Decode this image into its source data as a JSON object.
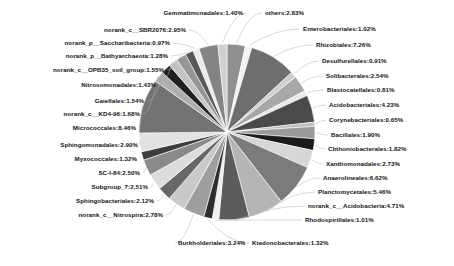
{
  "chart_data": {
    "type": "pie",
    "title": "",
    "subtitle": "",
    "xlabel": "",
    "ylabel": "",
    "legend_position": "none",
    "grid": false,
    "value_unit": "percent",
    "categories": [
      "others",
      "Enterobacteriales",
      "Rhizobiales",
      "Desulfurellales",
      "Solibacterales",
      "Blastocatellales",
      "Acidobacteriales",
      "Corynebacteriales",
      "Bacillales",
      "Chthoniobacterales",
      "Xanthomonadales",
      "Anaerolineales",
      "Planctomycetales",
      "norank_c__Acidobacteria",
      "Rhodospirillales",
      "Ktedonobacterales",
      "Burkholderiales",
      "norank_c__Nitrospira",
      "Sphingobacteriales",
      "Subgroup_7",
      "SC-I-84",
      "Myxococcales",
      "Sphingomonadales",
      "Micrococcales",
      "norank_c__KD4-96",
      "Gaiellales",
      "Nitrosomonadales",
      "norank_c__OPB35_soil_group",
      "norank_p__Bathyarchaeota",
      "norank_p__Saccharibacteria",
      "norank_c__SBR2076",
      "Gemmatimonadales"
    ],
    "values": [
      2.83,
      1.02,
      7.26,
      0.91,
      2.54,
      0.81,
      4.23,
      0.65,
      1.9,
      1.82,
      2.73,
      6.62,
      5.46,
      4.71,
      1.01,
      1.32,
      3.24,
      2.78,
      2.12,
      2.51,
      2.5,
      1.32,
      2.9,
      8.46,
      1.68,
      1.54,
      1.43,
      1.55,
      1.28,
      0.97,
      2.95,
      1.4
    ],
    "labels": [
      "others:2.83%",
      "Enterobacteriales:1.02%",
      "Rhizobiales:7.26%",
      "Desulfurellales:0.91%",
      "Solibacterales:2.54%",
      "Blastocatellales:0.81%",
      "Acidobacteriales:4.23%",
      "Corynebacteriales:0.65%",
      "Bacillales:1.90%",
      "Chthoniobacterales:1.82%",
      "Xanthomonadales:2.73%",
      "Anaerolineales:6.62%",
      "Planctomycetales:5.46%",
      "norank_c__Acidobacteria:4.71%",
      "Rhodospirillales:1.01%",
      "Ktedonobacterales:1.32%",
      "Burkholderiales:3.24%",
      "norank_c__Nitrospira:2.78%",
      "Sphingobacteriales:2.12%",
      "Subgroup_7:2.51%",
      "SC-I-84:2.50%",
      "Myxococcales:1.32%",
      "Sphingomonadales:2.90%",
      "Micrococcales:8.46%",
      "norank_c__KD4-96:1.68%",
      "Gaiellales:1.54%",
      "Nitrosomonadales:1.43%",
      "norank_c__OPB35_soil_group:1.55%",
      "norank_p__Bathyarchaeota:1.28%",
      "norank_p__Saccharibacteria:0.97%",
      "norank_c__SBR2076:2.95%",
      "Gemmatimonadales:1.40%"
    ],
    "colors": [
      "#8f8f8f",
      "#f2f2f2",
      "#6e6e6e",
      "#cfcfcf",
      "#a8a8a8",
      "#e8e8e8",
      "#4a4a4a",
      "#bdbdbd",
      "#9a9a9a",
      "#1a1a1a",
      "#d6d6d6",
      "#7b7b7b",
      "#b5b5b5",
      "#5c5c5c",
      "#efefef",
      "#2e2e2e",
      "#9e9e9e",
      "#c9c9c9",
      "#676767",
      "#dcdcdc",
      "#8a8a8a",
      "#3d3d3d",
      "#e2e2e2",
      "#737373",
      "#aeaeae",
      "#202020",
      "#c4c4c4",
      "#969696",
      "#585858",
      "#ebebeb",
      "#848484",
      "#d0d0d0"
    ]
  },
  "labels_layout": {
    "left": [
      {
        "id": "gemmatimonadales",
        "text": "Gemmatimonadales:1.40%",
        "x": 243,
        "y": 13,
        "align": "r"
      },
      {
        "id": "norank-sbr2076",
        "text": "norank_c__SBR2076:2.95%",
        "x": 186,
        "y": 30,
        "align": "r"
      },
      {
        "id": "norank-saccharibacteria",
        "text": "norank_p__Saccharibacteria:0.97%",
        "x": 170,
        "y": 43,
        "align": "r"
      },
      {
        "id": "norank-bathyarchaeota",
        "text": "norank_p__Bathyarchaeota:1.28%",
        "x": 168,
        "y": 56,
        "align": "r"
      },
      {
        "id": "norank-opb35",
        "text": "norank_c__OPB35_soil_group:1.55%",
        "x": 164,
        "y": 70,
        "align": "r"
      },
      {
        "id": "nitrosomonadales",
        "text": "Nitrosomonadales:1.43%",
        "x": 156,
        "y": 85,
        "align": "r"
      },
      {
        "id": "gaiellales",
        "text": "Gaiellales:1.54%",
        "x": 144,
        "y": 101,
        "align": "r"
      },
      {
        "id": "norank-kd4-96",
        "text": "norank_c__KD4-96:1.68%",
        "x": 140,
        "y": 114,
        "align": "r"
      },
      {
        "id": "micrococcales",
        "text": "Micrococcales:8.46%",
        "x": 136,
        "y": 128,
        "align": "r"
      },
      {
        "id": "sphingomonadales",
        "text": "Sphingomonadales:2.90%",
        "x": 138,
        "y": 145,
        "align": "r"
      },
      {
        "id": "myxococcales",
        "text": "Myxococcales:1.32%",
        "x": 137,
        "y": 159,
        "align": "r"
      },
      {
        "id": "sc-i-84",
        "text": "SC-I-84:2.50%",
        "x": 140,
        "y": 173,
        "align": "r"
      },
      {
        "id": "subgroup-7",
        "text": "Subgroup_7:2.51%",
        "x": 148,
        "y": 187,
        "align": "r"
      },
      {
        "id": "sphingobacteriales",
        "text": "Sphingobacteriales:2.12%",
        "x": 154,
        "y": 201,
        "align": "r"
      },
      {
        "id": "norank-nitrospira",
        "text": "norank_c__Nitrospira:2.78%",
        "x": 163,
        "y": 215,
        "align": "r"
      }
    ],
    "right": [
      {
        "id": "others",
        "text": "others:2.83%",
        "x": 265,
        "y": 13,
        "align": "l"
      },
      {
        "id": "enterobacteriales",
        "text": "Enterobacteriales:1.02%",
        "x": 303,
        "y": 29,
        "align": "l"
      },
      {
        "id": "rhizobiales",
        "text": "Rhizobiales:7.26%",
        "x": 316,
        "y": 45,
        "align": "l"
      },
      {
        "id": "desulfurellales",
        "text": "Desulfurellales:0.91%",
        "x": 322,
        "y": 61,
        "align": "l"
      },
      {
        "id": "solibacterales",
        "text": "Solibacterales:2.54%",
        "x": 326,
        "y": 76,
        "align": "l"
      },
      {
        "id": "blastocatellales",
        "text": "Blastocatellales:0.81%",
        "x": 327,
        "y": 90,
        "align": "l"
      },
      {
        "id": "acidobacteriales",
        "text": "Acidobacteriales:4.23%",
        "x": 329,
        "y": 105,
        "align": "l"
      },
      {
        "id": "corynebacteriales",
        "text": "Corynebacteriales:0.65%",
        "x": 329,
        "y": 120,
        "align": "l"
      },
      {
        "id": "bacillales",
        "text": "Bacillales:1.90%",
        "x": 331,
        "y": 135,
        "align": "l"
      },
      {
        "id": "chthoniobacterales",
        "text": "Chthoniobacterales:1.82%",
        "x": 328,
        "y": 149,
        "align": "l"
      },
      {
        "id": "xanthomonadales",
        "text": "Xanthomonadales:2.73%",
        "x": 326,
        "y": 164,
        "align": "l"
      },
      {
        "id": "anaerolineales",
        "text": "Anaerolineales:6.62%",
        "x": 323,
        "y": 178,
        "align": "l"
      },
      {
        "id": "planctomycetales",
        "text": "Planctomycetales:5.46%",
        "x": 318,
        "y": 192,
        "align": "l"
      },
      {
        "id": "norank-acidobacteria",
        "text": "norank_c__Acidobacteria:4.71%",
        "x": 308,
        "y": 206,
        "align": "l"
      },
      {
        "id": "rhodospirillales",
        "text": "Rhodospirillales:1.01%",
        "x": 305,
        "y": 220,
        "align": "l"
      }
    ],
    "bottom": [
      {
        "id": "burkholderiales",
        "text": "Burkholderiales:3.24%",
        "x": 178,
        "y": 243,
        "align": "l"
      },
      {
        "id": "ktedonobacterales",
        "text": "Ktedonobacterales:1.32%",
        "x": 252,
        "y": 243,
        "align": "l"
      }
    ]
  }
}
